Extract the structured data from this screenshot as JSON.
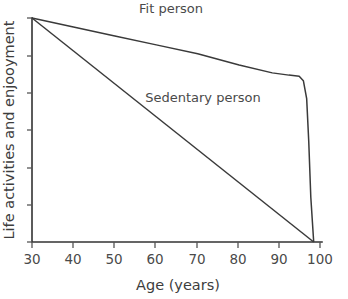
{
  "chart_data": {
    "type": "line",
    "title": "",
    "xlabel": "Age (years)",
    "ylabel": "Life activities and enjooyment",
    "xlim": [
      30,
      100
    ],
    "ylim": [
      0,
      100
    ],
    "grid": false,
    "legend_position": "inline-annotations",
    "x_ticks": [
      30,
      40,
      50,
      60,
      70,
      80,
      90,
      100
    ],
    "x_tick_labels": [
      "30",
      "40",
      "50",
      "60",
      "70",
      "80",
      "90",
      "100"
    ],
    "y_ticks": [
      0,
      16.7,
      33.3,
      50,
      66.7,
      83.3,
      100
    ],
    "y_tick_labels": [
      "",
      "",
      "",
      "",
      "",
      "",
      ""
    ],
    "series": [
      {
        "name": "Fit person",
        "color": "#3a3a3a",
        "x": [
          30,
          40,
          50,
          60,
          70,
          80,
          88,
          92,
          94.5,
          95.5,
          96.3,
          96.8,
          97.3,
          98
        ],
        "values": [
          100,
          96,
          92,
          88,
          84,
          79,
          75.5,
          74.5,
          74,
          72,
          64,
          45,
          20,
          0
        ]
      },
      {
        "name": "Sedentary person",
        "color": "#3a3a3a",
        "x": [
          30,
          98
        ],
        "values": [
          100,
          0
        ]
      }
    ],
    "annotations": [
      {
        "text": "Fit person",
        "x": 62,
        "y": 104
      },
      {
        "text": "Sedentary person",
        "x": 71,
        "y": 62
      }
    ]
  },
  "axes": {
    "x_axis_title": "Age (years)",
    "y_axis_title": "Life activities and enjooyment"
  },
  "colors": {
    "background": "#ffffff",
    "axis": "#333333",
    "line": "#3a3a3a",
    "text": "#4a4a4a"
  }
}
